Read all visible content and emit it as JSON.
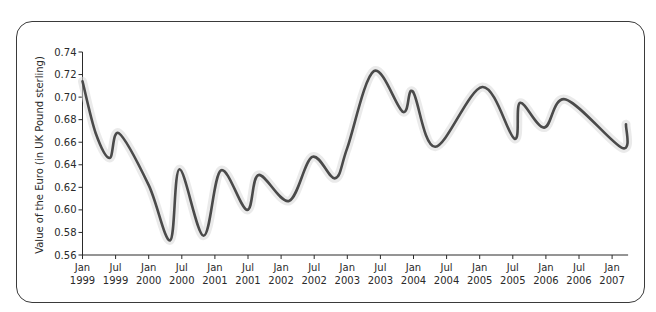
{
  "chart_data": {
    "type": "line",
    "title": "",
    "xlabel": "",
    "ylabel": "Value of the Euro (in UK Pound sterling)",
    "ylim": [
      0.56,
      0.74
    ],
    "yticks": [
      "0.56",
      "0.58",
      "0.60",
      "0.62",
      "0.64",
      "0.66",
      "0.68",
      "0.70",
      "0.72",
      "0.74"
    ],
    "xticks": [
      {
        "month": "Jan",
        "year": "1999"
      },
      {
        "month": "Jul",
        "year": "1999"
      },
      {
        "month": "Jan",
        "year": "2000"
      },
      {
        "month": "Jul",
        "year": "2000"
      },
      {
        "month": "Jan",
        "year": "2001"
      },
      {
        "month": "Jul",
        "year": "2001"
      },
      {
        "month": "Jan",
        "year": "2002"
      },
      {
        "month": "Jul",
        "year": "2002"
      },
      {
        "month": "Jan",
        "year": "2003"
      },
      {
        "month": "Jul",
        "year": "2003"
      },
      {
        "month": "Jan",
        "year": "2004"
      },
      {
        "month": "Jul",
        "year": "2004"
      },
      {
        "month": "Jan",
        "year": "2005"
      },
      {
        "month": "Jul",
        "year": "2005"
      },
      {
        "month": "Jan",
        "year": "2006"
      },
      {
        "month": "Jul",
        "year": "2006"
      },
      {
        "month": "Jan",
        "year": "2007"
      }
    ],
    "grid": false,
    "legend": null,
    "series": [
      {
        "name": "EUR/GBP",
        "color": "#4a4a4a",
        "points": [
          {
            "t": 0.0,
            "v": 0.714
          },
          {
            "t": 0.4,
            "v": 0.668
          },
          {
            "t": 0.82,
            "v": 0.646
          },
          {
            "t": 1.1,
            "v": 0.668
          },
          {
            "t": 2.0,
            "v": 0.622
          },
          {
            "t": 2.65,
            "v": 0.573
          },
          {
            "t": 2.93,
            "v": 0.636
          },
          {
            "t": 3.66,
            "v": 0.577
          },
          {
            "t": 4.18,
            "v": 0.635
          },
          {
            "t": 4.97,
            "v": 0.6
          },
          {
            "t": 5.32,
            "v": 0.631
          },
          {
            "t": 6.24,
            "v": 0.608
          },
          {
            "t": 6.94,
            "v": 0.647
          },
          {
            "t": 7.63,
            "v": 0.628
          },
          {
            "t": 8.0,
            "v": 0.655
          },
          {
            "t": 8.8,
            "v": 0.723
          },
          {
            "t": 9.68,
            "v": 0.687
          },
          {
            "t": 9.98,
            "v": 0.705
          },
          {
            "t": 10.66,
            "v": 0.656
          },
          {
            "t": 12.08,
            "v": 0.709
          },
          {
            "t": 13.05,
            "v": 0.663
          },
          {
            "t": 13.22,
            "v": 0.695
          },
          {
            "t": 13.95,
            "v": 0.673
          },
          {
            "t": 14.6,
            "v": 0.698
          },
          {
            "t": 16.3,
            "v": 0.655
          },
          {
            "t": 16.42,
            "v": 0.676
          }
        ]
      }
    ]
  }
}
